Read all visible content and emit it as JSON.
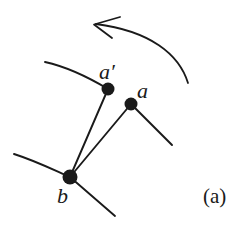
{
  "figure": {
    "caption": "(a)",
    "background_color": "#ffffff",
    "ink_color": "#1a1a1a",
    "width": 246,
    "height": 251
  },
  "labels": {
    "a_prime": "a′",
    "a": "a",
    "b": "b"
  },
  "diagram_data": {
    "type": "diagram",
    "description": "Graph fragment showing vertex a being moved to position a-prime, with a curved arrow indicating the direction of motion.",
    "nodes": [
      {
        "id": "a_prime",
        "label": "a′",
        "x": 108,
        "y": 89,
        "radius": 6.5,
        "filled": true
      },
      {
        "id": "a",
        "label": "a",
        "x": 131,
        "y": 104,
        "radius": 6.5,
        "filled": true
      },
      {
        "id": "b",
        "label": "b",
        "x": 70,
        "y": 177,
        "radius": 7.5,
        "filled": true
      }
    ],
    "edges": [
      {
        "id": "edge-aprime-b",
        "from": "a_prime",
        "to": "b",
        "style": "straight"
      },
      {
        "id": "edge-a-b",
        "from": "a",
        "to": "b",
        "style": "straight"
      }
    ],
    "pendant_edges": [
      {
        "id": "pendant-aprime-upleft",
        "from": "a_prime",
        "to_x": 45,
        "to_y": 62,
        "style": "curved"
      },
      {
        "id": "pendant-a-downright",
        "from": "a",
        "to_x": 172,
        "to_y": 145,
        "style": "straight"
      },
      {
        "id": "pendant-b-left",
        "from": "b",
        "to_x": 14,
        "to_y": 154,
        "style": "straight"
      },
      {
        "id": "pendant-b-downright",
        "from": "b",
        "to_x": 115,
        "to_y": 216,
        "style": "straight"
      }
    ],
    "motion_arrow": {
      "id": "motion-arrow",
      "shape": "curved",
      "direction": "right-to-left",
      "tail_x": 188,
      "tail_y": 83,
      "head_x": 95,
      "head_y": 24,
      "arrowhead": "open-v"
    }
  }
}
